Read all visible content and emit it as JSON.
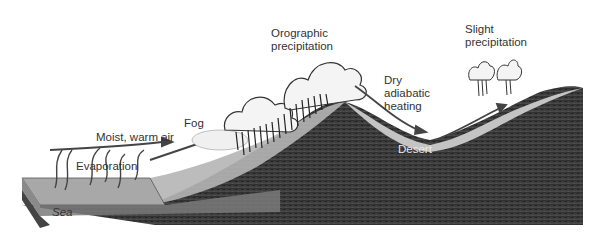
{
  "diagram": {
    "labels": {
      "moist_warm_air": "Moist, warm air",
      "evaporation": "Evaporation",
      "fog": "Fog",
      "orographic_precipitation": "Orographic\nprecipitation",
      "dry_adiabatic_heating": "Dry\nadiabatic\nheating",
      "slight_precipitation": "Slight\nprecipitation",
      "desert": "Desert",
      "sea": "Sea"
    },
    "colors": {
      "ground_dark": "#3a3a3a",
      "ground_surface": "#b8b8b8",
      "sea_top": "#a8a8a8",
      "sea_side": "#7a7a7a",
      "cloud": "#f2f2f2",
      "arrow": "#444444"
    }
  }
}
